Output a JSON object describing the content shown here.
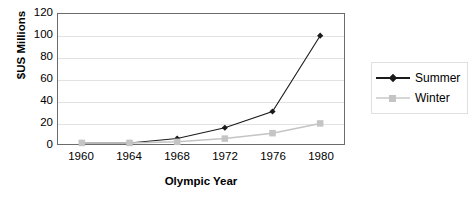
{
  "chart_data": {
    "type": "line",
    "title": "",
    "subtitle": "",
    "xlabel": "Olympic Year",
    "ylabel": "$US Millions",
    "categories": [
      "1960",
      "1964",
      "1968",
      "1972",
      "1976",
      "1980"
    ],
    "series": [
      {
        "name": "Summer",
        "color": "#1a1a1a",
        "marker": "diamond",
        "values": [
          1,
          1,
          5,
          15,
          30,
          100
        ]
      },
      {
        "name": "Winter",
        "color": "#c4c4c4",
        "marker": "square",
        "values": [
          1,
          1,
          2,
          5,
          10,
          19
        ]
      }
    ],
    "ylim": [
      0,
      120
    ],
    "yticks": [
      "0",
      "20",
      "40",
      "60",
      "80",
      "100",
      "120"
    ],
    "ytick_values": [
      0,
      20,
      40,
      60,
      80,
      100,
      120
    ],
    "xticks": [
      "1960",
      "1964",
      "1968",
      "1972",
      "1976",
      "1980"
    ],
    "grid": true,
    "grid_axis": "y",
    "legend_position": "right",
    "legend_entries": [
      "Summer",
      "Winter"
    ],
    "plot_border_color": "#6b6b6b",
    "gridline_color": "#e2e2e2",
    "background_color": "#ffffff"
  },
  "axes": {
    "y_title": "$US Millions",
    "x_title": "Olympic Year"
  },
  "legend": {
    "items": [
      {
        "label": "Summer"
      },
      {
        "label": "Winter"
      }
    ]
  }
}
